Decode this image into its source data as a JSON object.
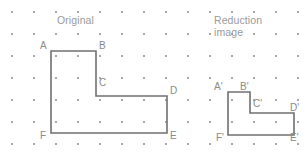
{
  "figure": {
    "width": 307,
    "height": 159,
    "background": "#ffffff",
    "grid": {
      "dot_color": "#8d8d8d",
      "dot_size": 2,
      "origin_x": 11,
      "origin_y": 11,
      "spacing_x": 22,
      "spacing_y": 22,
      "cols": 14,
      "rows": 7
    },
    "stroke_color": "#707070",
    "label_color": "#8a8a8a",
    "caption_color": "#9a9a9a"
  },
  "captions": {
    "original": {
      "text": "Original",
      "x": 57,
      "y": 15
    },
    "reduction": {
      "text": "Reduction\nimage",
      "x": 214,
      "y": 15
    }
  },
  "shapes": [
    {
      "id": "original-shape",
      "name": "original-polygon",
      "points": "51,51 96,51 96,96 167,96 167,133 51,133",
      "vertices": [
        {
          "label": "A",
          "x": 51,
          "y": 51,
          "lx": 40,
          "ly": 41
        },
        {
          "label": "B",
          "x": 96,
          "y": 51,
          "lx": 99,
          "ly": 41
        },
        {
          "label": "C",
          "x": 96,
          "y": 96,
          "lx": 99,
          "ly": 78
        },
        {
          "label": "D",
          "x": 167,
          "y": 96,
          "lx": 170,
          "ly": 86
        },
        {
          "label": "E",
          "x": 167,
          "y": 133,
          "lx": 170,
          "ly": 131
        },
        {
          "label": "F",
          "x": 51,
          "y": 133,
          "lx": 40,
          "ly": 131
        }
      ]
    },
    {
      "id": "reduction-shape",
      "name": "reduction-polygon",
      "points": "228,92 250,92 250,113 294,113 294,135 228,135",
      "vertices": [
        {
          "label": "A'",
          "x": 228,
          "y": 92,
          "lx": 214,
          "ly": 82
        },
        {
          "label": "B'",
          "x": 250,
          "y": 92,
          "lx": 240,
          "ly": 82
        },
        {
          "label": "C'",
          "x": 250,
          "y": 113,
          "lx": 253,
          "ly": 99
        },
        {
          "label": "D'",
          "x": 294,
          "y": 113,
          "lx": 290,
          "ly": 103
        },
        {
          "label": "E'",
          "x": 294,
          "y": 135,
          "lx": 290,
          "ly": 133
        },
        {
          "label": "F'",
          "x": 228,
          "y": 135,
          "lx": 216,
          "ly": 133
        }
      ]
    }
  ]
}
